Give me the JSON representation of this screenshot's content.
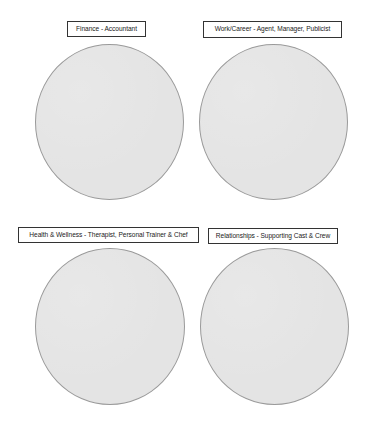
{
  "diagram": {
    "type": "labeled-circle-grid",
    "colors": {
      "circle_fill": "#e4e4e4",
      "circle_stroke": "#9a9a9a",
      "label_border": "#333333",
      "label_text": "#222222",
      "background": "#ffffff"
    },
    "quadrants": [
      {
        "label": "Finance - Accountant"
      },
      {
        "label": "Work/Career - Agent, Manager, Publicist"
      },
      {
        "label": "Health & Wellness - Therapist, Personal Trainer & Chef"
      },
      {
        "label": "Relationships - Supporting Cast & Crew"
      }
    ]
  }
}
